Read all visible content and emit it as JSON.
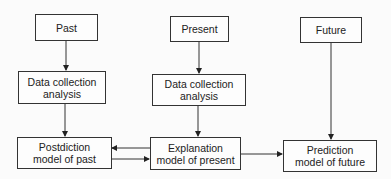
{
  "diagram": {
    "columns": [
      {
        "header": "Past",
        "analysis": [
          "Data collection",
          "analysis"
        ],
        "model": [
          "Postdiction",
          "model of past"
        ]
      },
      {
        "header": "Present",
        "analysis": [
          "Data collection",
          "analysis"
        ],
        "model": [
          "Explanation",
          "model of present"
        ]
      },
      {
        "header": "Future",
        "model": [
          "Prediction",
          "model of future"
        ]
      }
    ],
    "edges": [
      {
        "from": "Past",
        "to": "Data collection analysis (past)"
      },
      {
        "from": "Data collection analysis (past)",
        "to": "Postdiction model of past"
      },
      {
        "from": "Present",
        "to": "Data collection analysis (present)"
      },
      {
        "from": "Data collection analysis (present)",
        "to": "Explanation model of present"
      },
      {
        "from": "Future",
        "to": "Prediction model of future"
      },
      {
        "from": "Postdiction model of past",
        "to": "Explanation model of present"
      },
      {
        "from": "Explanation model of present",
        "to": "Postdiction model of past"
      },
      {
        "from": "Explanation model of present",
        "to": "Prediction model of future"
      }
    ]
  }
}
